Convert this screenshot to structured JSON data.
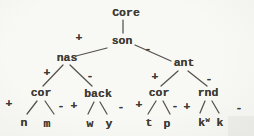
{
  "figure": {
    "background": "#f6f6f3",
    "ink": "#3e3a34",
    "type": "feature-tree-diagram"
  },
  "tree": {
    "root": {
      "label": "Core"
    },
    "son": {
      "label": "son",
      "plus": "+",
      "minus": "-"
    },
    "nas": {
      "label": "nas",
      "plus": "+",
      "minus": "-"
    },
    "ant": {
      "label": "ant",
      "plus": "+",
      "minus": "-"
    },
    "cor_left": {
      "label": "cor",
      "plus": "+",
      "minus": "-",
      "left_leaf": "n",
      "right_leaf": "m"
    },
    "back": {
      "label": "back",
      "plus": "+",
      "minus": "-",
      "left_leaf": "w",
      "right_leaf": "y"
    },
    "cor_right": {
      "label": "cor",
      "plus": "+",
      "minus": "-",
      "left_leaf": "t",
      "right_leaf": "p"
    },
    "rnd": {
      "label": "rnd",
      "plus": "+",
      "minus": "-",
      "left_leaf_base": "k",
      "left_leaf_sup": "w",
      "right_leaf": "k"
    }
  }
}
